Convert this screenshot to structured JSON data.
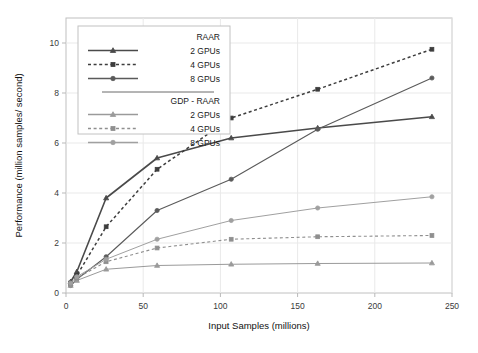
{
  "chart_data": {
    "type": "line",
    "title": "",
    "xlabel": "Input Samples (millions)",
    "ylabel": "Performance (million samples/ second)",
    "xlim": [
      0,
      250
    ],
    "ylim": [
      0,
      11
    ],
    "xticks": [
      0,
      50,
      100,
      150,
      200,
      250
    ],
    "yticks": [
      0,
      2,
      4,
      6,
      8,
      10
    ],
    "grid": true,
    "legend_position": "upper-left",
    "legend_groups": [
      {
        "title": "RAAR",
        "entries": [
          {
            "label": "2 GPUs",
            "marker": "triangle",
            "dash": "solid",
            "color": "#4a4a4a"
          },
          {
            "label": "4 GPUs",
            "marker": "square",
            "dash": "dashed",
            "color": "#3d3d3d"
          },
          {
            "label": "8 GPUs",
            "marker": "circle",
            "dash": "solid",
            "color": "#5a5a5a"
          }
        ]
      },
      {
        "title": "GDP - RAAR",
        "entries": [
          {
            "label": "2 GPUs",
            "marker": "triangle",
            "dash": "solid",
            "color": "#9a9a9a"
          },
          {
            "label": "4 GPUs",
            "marker": "square",
            "dash": "dashed",
            "color": "#8f8f8f"
          },
          {
            "label": "8 GPUs",
            "marker": "circle",
            "dash": "solid",
            "color": "#a0a0a0"
          }
        ]
      }
    ],
    "series": [
      {
        "name": "RAAR 2 GPUs",
        "group": "RAAR",
        "marker": "triangle",
        "dash": "solid",
        "color": "#4a4a4a",
        "width": 1.6,
        "x": [
          3,
          7,
          26,
          59,
          107,
          163,
          237
        ],
        "y": [
          0.45,
          0.85,
          3.8,
          5.4,
          6.2,
          6.6,
          7.05
        ]
      },
      {
        "name": "RAAR 4 GPUs",
        "group": "RAAR",
        "marker": "square",
        "dash": "dashed",
        "color": "#3d3d3d",
        "width": 1.5,
        "x": [
          3,
          7,
          26,
          59,
          107,
          163,
          237
        ],
        "y": [
          0.4,
          0.7,
          2.65,
          4.95,
          7.0,
          8.15,
          9.75
        ]
      },
      {
        "name": "RAAR 8 GPUs",
        "group": "RAAR",
        "marker": "circle",
        "dash": "solid",
        "color": "#5a5a5a",
        "width": 1.1,
        "x": [
          3,
          7,
          26,
          59,
          107,
          163,
          237
        ],
        "y": [
          0.3,
          0.55,
          1.45,
          3.3,
          4.55,
          6.55,
          8.6
        ]
      },
      {
        "name": "GDP - RAAR 2 GPUs",
        "group": "GDP - RAAR",
        "marker": "triangle",
        "dash": "solid",
        "color": "#9a9a9a",
        "width": 1.0,
        "x": [
          3,
          7,
          26,
          59,
          107,
          163,
          237
        ],
        "y": [
          0.3,
          0.5,
          0.95,
          1.1,
          1.15,
          1.18,
          1.2
        ]
      },
      {
        "name": "GDP - RAAR 4 GPUs",
        "group": "GDP - RAAR",
        "marker": "square",
        "dash": "dashed",
        "color": "#8f8f8f",
        "width": 1.1,
        "x": [
          3,
          7,
          26,
          59,
          107,
          163,
          237
        ],
        "y": [
          0.35,
          0.6,
          1.25,
          1.8,
          2.15,
          2.25,
          2.3
        ]
      },
      {
        "name": "GDP - RAAR 8 GPUs",
        "group": "GDP - RAAR",
        "marker": "circle",
        "dash": "solid",
        "color": "#a0a0a0",
        "width": 1.0,
        "x": [
          3,
          7,
          26,
          59,
          107,
          163,
          237
        ],
        "y": [
          0.4,
          0.65,
          1.35,
          2.15,
          2.9,
          3.4,
          3.85
        ]
      }
    ]
  }
}
